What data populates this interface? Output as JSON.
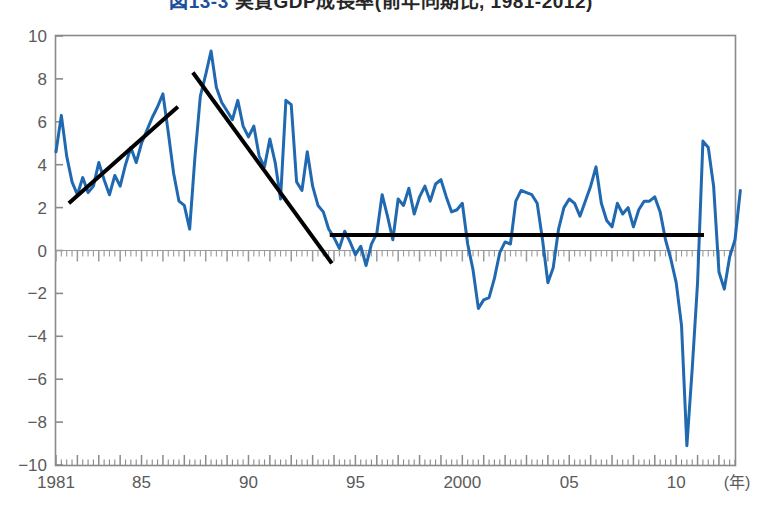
{
  "chart_data": {
    "type": "line",
    "title": "図13-3 実質GDP成長率(前年同期比, 1981-2012)",
    "title_figure_number": "図13-3",
    "title_text": "実質GDP成長率(前年同期比, 1981-2012)",
    "xlabel": "",
    "ylabel": "",
    "x_unit_label": "(年)",
    "xlim": [
      1981.0,
      2012.75
    ],
    "ylim": [
      -10,
      10
    ],
    "y_ticks": [
      10,
      8,
      6,
      4,
      2,
      0,
      -2,
      -4,
      -6,
      -8,
      -10
    ],
    "y_tick_labels": [
      "10",
      "8",
      "6",
      "4",
      "2",
      "0",
      "-2",
      "-4",
      "-6",
      "-8",
      "-10"
    ],
    "x_ticks": [
      1981,
      1985,
      1990,
      1995,
      2000,
      2005,
      2010
    ],
    "x_tick_labels": [
      "1981",
      "85",
      "90",
      "95",
      "2000",
      "05",
      "10"
    ],
    "x_minor_tick_interval": 0.25,
    "grid": false,
    "legend": null,
    "series": [
      {
        "name": "実質GDP成長率(前年同期比)",
        "color": "#2069b0",
        "line_width": 3,
        "x_start": 1981.0,
        "x_step": 0.25,
        "values": [
          4.6,
          6.3,
          4.4,
          3.2,
          2.6,
          3.4,
          2.7,
          3.0,
          4.1,
          3.3,
          2.6,
          3.5,
          3.0,
          4.0,
          4.8,
          4.1,
          5.0,
          5.6,
          6.2,
          6.7,
          7.3,
          5.5,
          3.6,
          2.3,
          2.1,
          1.0,
          4.4,
          7.2,
          8.2,
          9.3,
          7.6,
          6.9,
          6.5,
          6.1,
          7.0,
          5.8,
          5.3,
          5.8,
          4.4,
          3.9,
          5.2,
          4.1,
          2.4,
          7.0,
          6.8,
          3.2,
          2.8,
          4.6,
          3.0,
          2.1,
          1.8,
          1.0,
          0.6,
          0.1,
          0.9,
          0.4,
          -0.2,
          0.2,
          -0.7,
          0.3,
          0.8,
          2.6,
          1.6,
          0.5,
          2.4,
          2.1,
          2.9,
          1.7,
          2.5,
          3.0,
          2.3,
          3.1,
          3.3,
          2.5,
          1.8,
          1.9,
          2.2,
          0.3,
          -0.9,
          -2.7,
          -2.3,
          -2.2,
          -1.3,
          -0.1,
          0.4,
          0.3,
          2.3,
          2.8,
          2.7,
          2.6,
          2.2,
          0.5,
          -1.5,
          -0.8,
          1.0,
          2.0,
          2.4,
          2.2,
          1.6,
          2.3,
          3.0,
          3.9,
          2.2,
          1.4,
          1.1,
          2.2,
          1.7,
          2.0,
          1.1,
          1.9,
          2.3,
          2.3,
          2.5,
          1.8,
          0.5,
          -0.4,
          -1.5,
          -3.5,
          -9.1,
          -5.5,
          -1.5,
          5.1,
          4.8,
          3.0,
          -1.0,
          -1.8,
          -0.3,
          0.5,
          2.8
        ]
      }
    ],
    "trend_lines": [
      {
        "name": "upward-trend-1981-1987",
        "color": "#000000",
        "line_width": 4,
        "x0": 1981.6,
        "y0": 2.2,
        "x1": 1986.7,
        "y1": 6.7
      },
      {
        "name": "downward-trend-1987-1994",
        "color": "#000000",
        "line_width": 4,
        "x0": 1987.4,
        "y0": 8.3,
        "x1": 1993.9,
        "y1": -0.6
      },
      {
        "name": "flat-trend-1994-2011",
        "color": "#000000",
        "line_width": 4,
        "x0": 1993.8,
        "y0": 0.72,
        "x1": 2011.3,
        "y1": 0.72
      }
    ]
  }
}
